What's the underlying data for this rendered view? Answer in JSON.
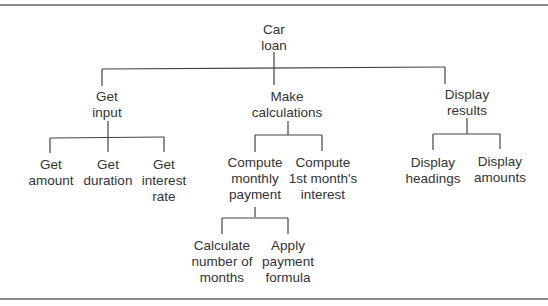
{
  "diagram": {
    "type": "hierarchy-chart",
    "root": {
      "id": "car-loan",
      "lines": [
        "Car",
        "loan"
      ],
      "children": [
        {
          "id": "get-input",
          "lines": [
            "Get",
            "input"
          ],
          "children": [
            {
              "id": "get-amount",
              "lines": [
                "Get",
                "amount"
              ]
            },
            {
              "id": "get-duration",
              "lines": [
                "Get",
                "duration"
              ]
            },
            {
              "id": "get-interest-rate",
              "lines": [
                "Get",
                "interest",
                "rate"
              ]
            }
          ]
        },
        {
          "id": "make-calculations",
          "lines": [
            "Make",
            "calculations"
          ],
          "children": [
            {
              "id": "compute-monthly-payment",
              "lines": [
                "Compute",
                "monthly",
                "payment"
              ],
              "children": [
                {
                  "id": "calculate-number-of-months",
                  "lines": [
                    "Calculate",
                    "number of",
                    "months"
                  ]
                },
                {
                  "id": "apply-payment-formula",
                  "lines": [
                    "Apply",
                    "payment",
                    "formula"
                  ]
                }
              ]
            },
            {
              "id": "compute-first-months-interest",
              "lines": [
                "Compute",
                "1st month's",
                "interest"
              ]
            }
          ]
        },
        {
          "id": "display-results",
          "lines": [
            "Display",
            "results"
          ],
          "children": [
            {
              "id": "display-headings",
              "lines": [
                "Display",
                "headings"
              ]
            },
            {
              "id": "display-amounts",
              "lines": [
                "Display",
                "amounts"
              ]
            }
          ]
        }
      ]
    }
  },
  "colors": {
    "line": "#444444",
    "text": "#333333",
    "rule": "#8c8c8c",
    "background": "#ffffff"
  }
}
